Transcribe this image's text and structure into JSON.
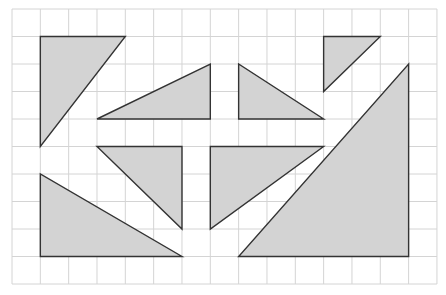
{
  "grid": {
    "columns": 15,
    "rows": 10,
    "origin_x": 12,
    "origin_y": 9,
    "cell_w": 28.33,
    "cell_h": 27.5,
    "line_color": "#d4d4d4",
    "background": "#ffffff"
  },
  "style": {
    "fill": "#d3d3d3",
    "stroke": "#333333",
    "stroke_width": 1.4
  },
  "shapes": [
    {
      "name": "triangle-top-left",
      "points": [
        [
          1,
          1
        ],
        [
          4,
          1
        ],
        [
          1,
          5
        ]
      ]
    },
    {
      "name": "triangle-upper-middle-left",
      "points": [
        [
          3,
          4
        ],
        [
          7,
          2
        ],
        [
          7,
          4
        ]
      ]
    },
    {
      "name": "triangle-upper-middle-right",
      "points": [
        [
          8,
          2
        ],
        [
          8,
          4
        ],
        [
          11,
          4
        ]
      ]
    },
    {
      "name": "triangle-top-right-small",
      "points": [
        [
          11,
          1
        ],
        [
          13,
          1
        ],
        [
          11,
          3
        ]
      ]
    },
    {
      "name": "triangle-center-left",
      "points": [
        [
          3,
          5
        ],
        [
          6,
          5
        ],
        [
          6,
          8
        ]
      ]
    },
    {
      "name": "triangle-center-right",
      "points": [
        [
          7,
          5
        ],
        [
          11,
          5
        ],
        [
          7,
          8
        ]
      ]
    },
    {
      "name": "triangle-bottom-left",
      "points": [
        [
          1,
          6
        ],
        [
          1,
          9
        ],
        [
          6,
          9
        ]
      ]
    },
    {
      "name": "triangle-bottom-right-large",
      "points": [
        [
          14,
          2
        ],
        [
          14,
          9
        ],
        [
          8,
          9
        ]
      ]
    }
  ]
}
